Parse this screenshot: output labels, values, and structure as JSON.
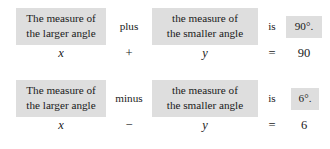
{
  "blocks": [
    {
      "left_phrase": {
        "line1": "The measure of",
        "line2": "the larger angle"
      },
      "operator_word": "plus",
      "right_phrase": {
        "line1": "the measure of",
        "line2": "the smaller angle"
      },
      "is_word": "is",
      "value_phrase": "90°.",
      "equation": {
        "left_var": "x",
        "operator": "+",
        "right_var": "y",
        "equals": "=",
        "result": "90"
      }
    },
    {
      "left_phrase": {
        "line1": "The measure of",
        "line2": "the larger angle"
      },
      "operator_word": "minus",
      "right_phrase": {
        "line1": "the measure of",
        "line2": "the smaller angle"
      },
      "is_word": "is",
      "value_phrase": "6°.",
      "equation": {
        "left_var": "x",
        "operator": "−",
        "right_var": "y",
        "equals": "=",
        "result": "6"
      }
    }
  ],
  "colors": {
    "background": "#ffffff",
    "phrase_box_shading": "#dedede",
    "text": "#1a1a1a"
  }
}
